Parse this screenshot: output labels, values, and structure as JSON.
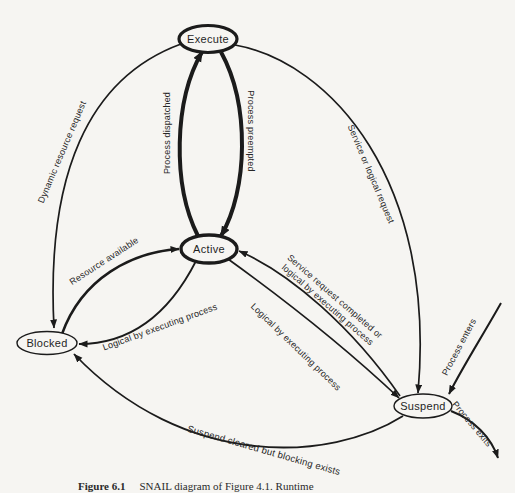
{
  "page": {
    "background_color": "#f6f5f2",
    "ink_color": "#1b1b1b"
  },
  "diagram": {
    "type": "state-transition-diagram",
    "nodes": {
      "execute": "Execute",
      "active": "Active",
      "blocked": "Blocked",
      "suspend": "Suspend"
    },
    "edge_labels": {
      "dynamic_resource_request": "Dynamic resource request",
      "process_dispatched": "Process dispatched",
      "process_preempted": "Process preempted",
      "service_or_logical_request": "Service or logical request",
      "resource_available": "Resource available",
      "service_request_completed_line1": "Service request completed or",
      "service_request_completed_line2": "logical by executing process",
      "logical_by_executing_to_blocked": "Logical by executing process",
      "logical_by_executing_to_suspend": "Logical by executing process",
      "process_enters": "Process enters",
      "process_exits": "Process exits",
      "suspend_cleared": "Suspend cleared but blocking exists"
    },
    "caption": {
      "label": "Figure 6.1",
      "text": "SNAIL diagram of Figure 4.1. Runtime"
    }
  }
}
